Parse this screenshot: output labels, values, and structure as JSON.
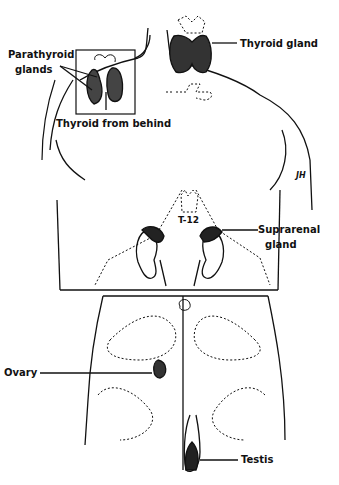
{
  "figure": {
    "type": "anatomical endocrine gland diagram",
    "labels": {
      "parathyroid_line1": "Parathyroid",
      "parathyroid_line2": "glands",
      "thyroid_from_behind": "Thyroid from behind",
      "thyroid_gland": "Thyroid gland",
      "t12": "T-12",
      "suprarenal_line1": "Suprarenal",
      "suprarenal_line2": "gland",
      "ovary": "Ovary",
      "testis": "Testis",
      "signature": "JH"
    },
    "colors": {
      "ink": "#111111",
      "background": "#ffffff"
    }
  }
}
